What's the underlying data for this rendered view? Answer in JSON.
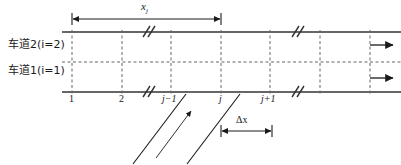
{
  "figure": {
    "type": "schematic-diagram",
    "lane_labels": [
      {
        "id": "lane-2",
        "text": "车道2(i=2)",
        "x": 8,
        "y": 45
      },
      {
        "id": "lane-1",
        "text": "车道1(i=1)",
        "x": 8,
        "y": 71
      }
    ],
    "cell_labels": [
      {
        "id": "cell-1",
        "text": "1",
        "italic": false,
        "x": 72
      },
      {
        "id": "cell-2",
        "text": "2",
        "italic": false,
        "x": 122
      },
      {
        "id": "cell-j-minus-1",
        "text": "j−1",
        "italic": true,
        "x": 171
      },
      {
        "id": "cell-j",
        "text": "j",
        "italic": true,
        "x": 221
      },
      {
        "id": "cell-j-plus-1",
        "text": "j+1",
        "italic": true,
        "x": 270
      }
    ],
    "dimensions": [
      {
        "id": "xj",
        "symbol": "x",
        "subscript": "j",
        "from_x": 72,
        "to_x": 221,
        "y": 18
      },
      {
        "id": "delta-x",
        "symbol": "Δx",
        "from_x": 221,
        "to_x": 272,
        "y": 131
      }
    ],
    "flow_arrows": [
      {
        "id": "flow-arrow-lane2",
        "y": 45
      },
      {
        "id": "flow-arrow-lane1",
        "y": 78
      }
    ],
    "break_marks": [
      {
        "id": "break-top-left",
        "x": 147,
        "y": 32
      },
      {
        "id": "break-top-right",
        "x": 296,
        "y": 32
      },
      {
        "id": "break-bottom-left",
        "x": 147,
        "y": 92
      },
      {
        "id": "break-bottom-right",
        "x": 296,
        "y": 92
      }
    ],
    "grid_lines_x": [
      72,
      122,
      171,
      221,
      270,
      320,
      370
    ],
    "road": {
      "top_y": 32,
      "bottom_y": 92,
      "center_y": 62,
      "left_x": 62,
      "right_x": 401
    },
    "diagonals": [
      {
        "id": "diagonal-left",
        "x1": 185,
        "y1": 95,
        "x2": 133,
        "y2": 163
      },
      {
        "id": "diagonal-right",
        "x1": 239,
        "y1": 95,
        "x2": 188,
        "y2": 163
      },
      {
        "id": "diagonal-direction-arrow",
        "x1": 155,
        "y1": 157,
        "x2": 192,
        "y2": 110
      }
    ],
    "colors": {
      "stroke": "#333333",
      "dashed": "#666666",
      "background": "#ffffff"
    }
  }
}
